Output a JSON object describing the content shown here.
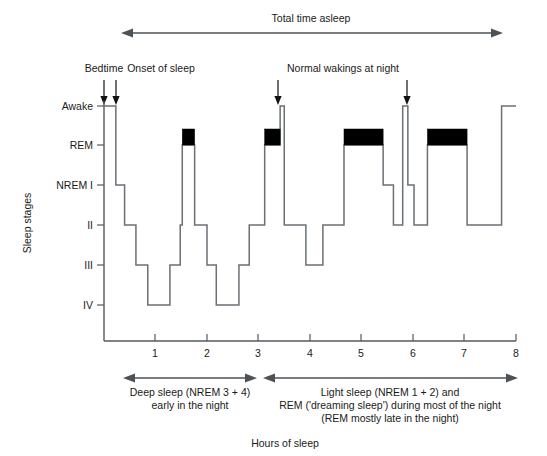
{
  "figure": {
    "title_top": "Total time asleep",
    "xlabel": "Hours of sleep",
    "ylabel": "Sleep stages"
  },
  "annotations": {
    "bedtime": "Bedtime",
    "onset": "Onset of sleep",
    "wakings": "Normal wakings at night",
    "deep_sleep_line1": "Deep sleep (NREM 3 + 4)",
    "deep_sleep_line2": "early in the night",
    "light_sleep_line1": "Light sleep (NREM 1 + 2) and",
    "light_sleep_line2": "REM ('dreaming sleep') during most of the night",
    "light_sleep_line3": "(REM mostly late in the night)"
  },
  "chart_data": {
    "type": "line",
    "title": "Total time asleep",
    "xlabel": "Hours of sleep",
    "ylabel": "Sleep stages",
    "xlim": [
      0,
      8
    ],
    "xticks": [
      1,
      2,
      3,
      4,
      5,
      6,
      7,
      8
    ],
    "xtick_labels": [
      "1",
      "2",
      "3",
      "4",
      "5",
      "6",
      "7",
      "8"
    ],
    "ytick_labels": [
      "Awake",
      "REM",
      "NREM I",
      "II",
      "III",
      "IV"
    ],
    "ylevels": [
      "Awake",
      "REM",
      "I",
      "II",
      "III",
      "IV"
    ],
    "grid": false,
    "legend": false,
    "steps": [
      {
        "t_start": 0.0,
        "t_end": 0.23,
        "stage": "Awake"
      },
      {
        "t_start": 0.23,
        "t_end": 0.4,
        "stage": "I"
      },
      {
        "t_start": 0.4,
        "t_end": 0.62,
        "stage": "II"
      },
      {
        "t_start": 0.62,
        "t_end": 0.85,
        "stage": "III"
      },
      {
        "t_start": 0.85,
        "t_end": 1.28,
        "stage": "IV"
      },
      {
        "t_start": 1.28,
        "t_end": 1.48,
        "stage": "III"
      },
      {
        "t_start": 1.48,
        "t_end": 1.52,
        "stage": "II"
      },
      {
        "t_start": 1.52,
        "t_end": 1.76,
        "stage": "REM"
      },
      {
        "t_start": 1.76,
        "t_end": 2.0,
        "stage": "II"
      },
      {
        "t_start": 2.0,
        "t_end": 2.18,
        "stage": "III"
      },
      {
        "t_start": 2.18,
        "t_end": 2.62,
        "stage": "IV"
      },
      {
        "t_start": 2.62,
        "t_end": 2.82,
        "stage": "III"
      },
      {
        "t_start": 2.82,
        "t_end": 3.12,
        "stage": "II"
      },
      {
        "t_start": 3.12,
        "t_end": 3.42,
        "stage": "REM"
      },
      {
        "t_start": 3.42,
        "t_end": 3.5,
        "stage": "Awake"
      },
      {
        "t_start": 3.5,
        "t_end": 3.92,
        "stage": "II"
      },
      {
        "t_start": 3.92,
        "t_end": 4.25,
        "stage": "III"
      },
      {
        "t_start": 4.25,
        "t_end": 4.66,
        "stage": "II"
      },
      {
        "t_start": 4.66,
        "t_end": 5.42,
        "stage": "REM"
      },
      {
        "t_start": 5.42,
        "t_end": 5.62,
        "stage": "I"
      },
      {
        "t_start": 5.62,
        "t_end": 5.8,
        "stage": "II"
      },
      {
        "t_start": 5.8,
        "t_end": 5.9,
        "stage": "Awake"
      },
      {
        "t_start": 5.9,
        "t_end": 6.02,
        "stage": "I"
      },
      {
        "t_start": 6.02,
        "t_end": 6.28,
        "stage": "II"
      },
      {
        "t_start": 6.28,
        "t_end": 7.05,
        "stage": "REM"
      },
      {
        "t_start": 7.05,
        "t_end": 7.72,
        "stage": "II"
      },
      {
        "t_start": 7.72,
        "t_end": 8.0,
        "stage": "Awake"
      }
    ],
    "rem_periods": [
      {
        "t_start": 1.52,
        "t_end": 1.76
      },
      {
        "t_start": 3.12,
        "t_end": 3.42
      },
      {
        "t_start": 4.66,
        "t_end": 5.42
      },
      {
        "t_start": 6.28,
        "t_end": 7.05
      }
    ],
    "markers": [
      {
        "label": "Bedtime",
        "t": 0.0
      },
      {
        "label": "Onset of sleep",
        "t": 0.23
      },
      {
        "label": "Normal wakings at night",
        "t": 3.42
      },
      {
        "label": "Normal wakings at night",
        "t": 5.88
      }
    ],
    "span_total_asleep": {
      "t_start": 0.35,
      "t_end": 7.72,
      "label": "Total time asleep"
    },
    "span_deep_sleep": {
      "t_start": 0.38,
      "t_end": 2.95,
      "label": "Deep sleep (NREM 3 + 4) early in the night"
    },
    "span_light_sleep": {
      "t_start": 3.08,
      "t_end": 7.75,
      "label": "Light sleep (NREM 1 + 2) and REM ('dreaming sleep') during most of the night (REM mostly late in the night)"
    }
  }
}
